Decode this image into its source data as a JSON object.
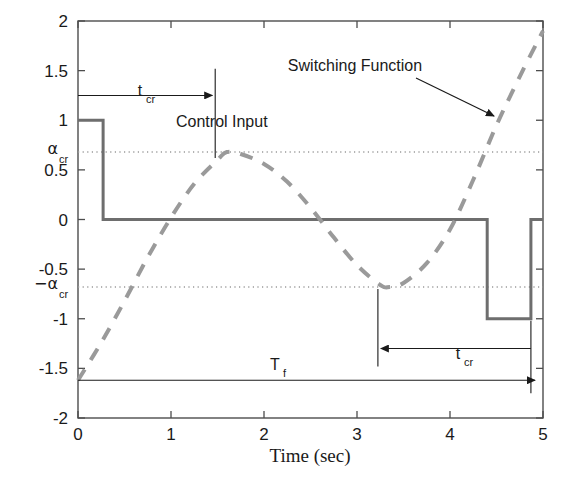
{
  "figure": {
    "background": "#ffffff",
    "axes_color": "#4d4d4d",
    "control_color": "#6e6e6e",
    "switching_color": "#9a9a9a",
    "dotted_color": "#9a9a9a",
    "annotation_color": "#1a1a1a"
  },
  "axis": {
    "xlabel": "Time (sec)",
    "ylabel": "",
    "xticks": [
      "0",
      "1",
      "2",
      "3",
      "4",
      "5"
    ],
    "xtick_values": [
      0,
      1,
      2,
      3,
      4,
      5
    ],
    "yticks": [
      "-2",
      "-1.5",
      "-1",
      "-0.5",
      "0",
      "0.5",
      "1",
      "1.5",
      "2"
    ],
    "ytick_values": [
      -2,
      -1.5,
      -1,
      -0.5,
      0,
      0.5,
      1,
      1.5,
      2
    ],
    "xlim": [
      0,
      5
    ],
    "ylim": [
      -2,
      2
    ]
  },
  "special_ticks": [
    {
      "name": "alpha-cr-positive",
      "base": "α",
      "sub": "cr",
      "value": 0.68
    },
    {
      "name": "alpha-cr-negative",
      "base": "−α",
      "sub": "cr",
      "value": -0.68
    }
  ],
  "annotations": {
    "control_input": {
      "label": "Control Input",
      "x": 1.05,
      "y": 0.93
    },
    "switching_function": {
      "label": "Switching Function",
      "x": 3.35,
      "y": 1.63
    },
    "t_cr_top": {
      "label": "t",
      "sub": "cr",
      "from_t": 0.0,
      "to_t": 1.4,
      "y": 1.25
    },
    "t_cr_bottom": {
      "label": "t",
      "sub": "cr",
      "from_t": 4.87,
      "to_t": 3.3,
      "y": -1.3
    },
    "T_f": {
      "label": "T",
      "sub": "f",
      "from_t": 0.0,
      "to_t": 4.87,
      "y": -1.62
    }
  },
  "chart_data": {
    "type": "line",
    "title": "",
    "xlabel": "Time (sec)",
    "ylabel": "",
    "xlim": [
      0,
      5
    ],
    "ylim": [
      -2,
      2
    ],
    "grid": false,
    "legend": "none (in-plot text annotations)",
    "series": [
      {
        "name": "Control Input",
        "style": "solid",
        "color": "#6e6e6e",
        "width": 3,
        "description": "bang-bang control: +1 then 0 then -1 then 0",
        "x": [
          0.0,
          0.27,
          0.27,
          4.4,
          4.4,
          4.87,
          4.87,
          5.0
        ],
        "y": [
          1.0,
          1.0,
          0.0,
          0.0,
          -1.0,
          -1.0,
          0.0,
          0.0
        ]
      },
      {
        "name": "Switching Function",
        "style": "dashed",
        "color": "#9a9a9a",
        "width": 4,
        "description": "sinusoidal switching function crossing +alpha_cr near t=1.6 and -alpha_cr near t=3.3",
        "x": [
          0.0,
          0.25,
          0.5,
          0.75,
          1.0,
          1.25,
          1.5,
          1.6,
          1.75,
          2.0,
          2.25,
          2.5,
          2.75,
          3.0,
          3.25,
          3.35,
          3.5,
          3.75,
          4.0,
          4.25,
          4.5,
          4.75,
          5.0
        ],
        "y": [
          -1.62,
          -1.24,
          -0.82,
          -0.38,
          0.02,
          0.36,
          0.6,
          0.68,
          0.66,
          0.56,
          0.38,
          0.12,
          -0.18,
          -0.46,
          -0.66,
          -0.68,
          -0.64,
          -0.44,
          -0.1,
          0.4,
          0.95,
          1.44,
          1.9
        ]
      }
    ],
    "reference_lines": [
      {
        "name": "alpha_cr",
        "y": 0.68,
        "style": "dotted",
        "color": "#9a9a9a"
      },
      {
        "name": "minus_alpha_cr",
        "y": -0.68,
        "style": "dotted",
        "color": "#9a9a9a"
      }
    ]
  }
}
